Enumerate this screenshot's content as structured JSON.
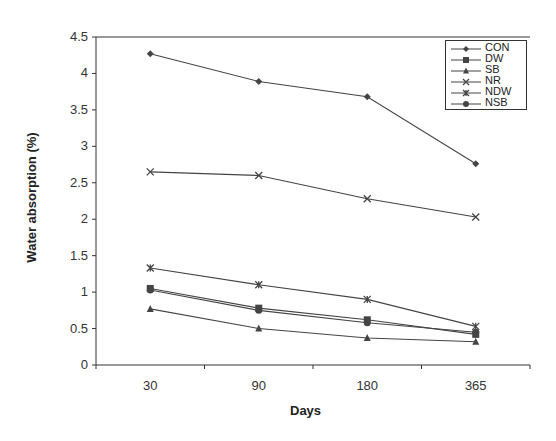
{
  "chart_data": {
    "type": "line",
    "title": "",
    "xlabel": "Days",
    "ylabel": "Water absorption (%)",
    "categories": [
      "30",
      "90",
      "180",
      "365"
    ],
    "ylim": [
      0,
      4.5
    ],
    "yticks": [
      "0",
      "0.5",
      "1",
      "1.5",
      "2",
      "2.5",
      "3",
      "3.5",
      "4",
      "4.5"
    ],
    "grid": false,
    "legend_position": "top-right",
    "series": [
      {
        "name": "CON",
        "marker": "diamond",
        "values": [
          4.27,
          3.89,
          3.68,
          2.76
        ]
      },
      {
        "name": "DW",
        "marker": "square",
        "values": [
          1.05,
          0.78,
          0.62,
          0.42
        ]
      },
      {
        "name": "SB",
        "marker": "triangle",
        "values": [
          0.77,
          0.5,
          0.37,
          0.32
        ]
      },
      {
        "name": "NR",
        "marker": "x",
        "values": [
          2.65,
          2.6,
          2.28,
          2.03
        ]
      },
      {
        "name": "NDW",
        "marker": "star",
        "values": [
          1.33,
          1.1,
          0.9,
          0.53
        ]
      },
      {
        "name": "NSB",
        "marker": "circle",
        "values": [
          1.03,
          0.75,
          0.58,
          0.45
        ]
      }
    ]
  },
  "colors": {
    "line": "#444444",
    "axis": "#333333"
  }
}
